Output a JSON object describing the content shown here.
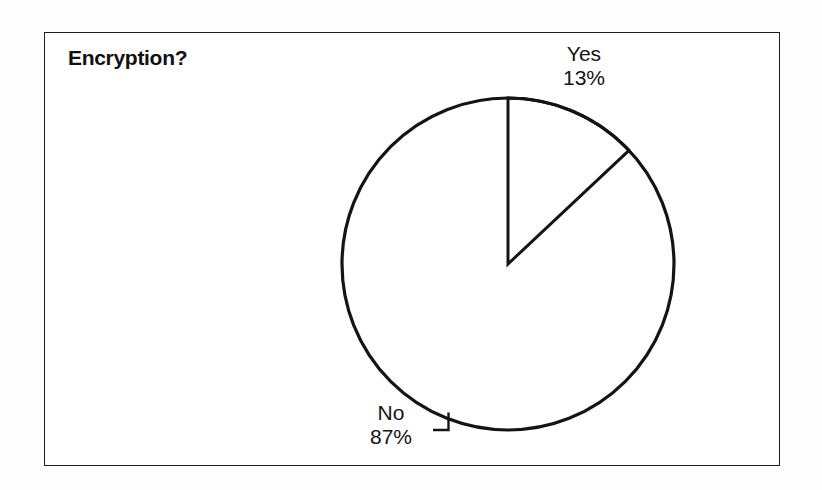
{
  "document": {
    "background_color": "#fefefe",
    "frame_color": "#1d1d1d",
    "frame_fill": "#ffffff"
  },
  "chart_title": "Encryption?",
  "labels": {
    "yes": {
      "name": "Yes",
      "value": "13%"
    },
    "no": {
      "name": "No",
      "value": "87%"
    }
  },
  "chart_data": {
    "type": "pie",
    "title": "Encryption?",
    "xlabel": "",
    "ylabel": "",
    "categories": [
      "Yes",
      "No"
    ],
    "values": [
      13,
      87
    ],
    "value_unit": "%",
    "slices": [
      {
        "label": "Yes",
        "value": 13,
        "display_value": "13%",
        "start_angle_deg": 0,
        "end_angle_deg": 46.8,
        "fill": "#ffffff",
        "stroke": "#141414",
        "label_position": "outside-top-right",
        "leader_line": false
      },
      {
        "label": "No",
        "value": 87,
        "display_value": "87%",
        "start_angle_deg": 46.8,
        "end_angle_deg": 360,
        "fill": "#ffffff",
        "stroke": "#141414",
        "label_position": "outside-bottom-left",
        "leader_line": true
      }
    ],
    "start_angle_deg": 0,
    "direction": "clockwise",
    "grid": false,
    "legend": "none",
    "label_style": "outside-with-leader",
    "monochrome": true
  }
}
